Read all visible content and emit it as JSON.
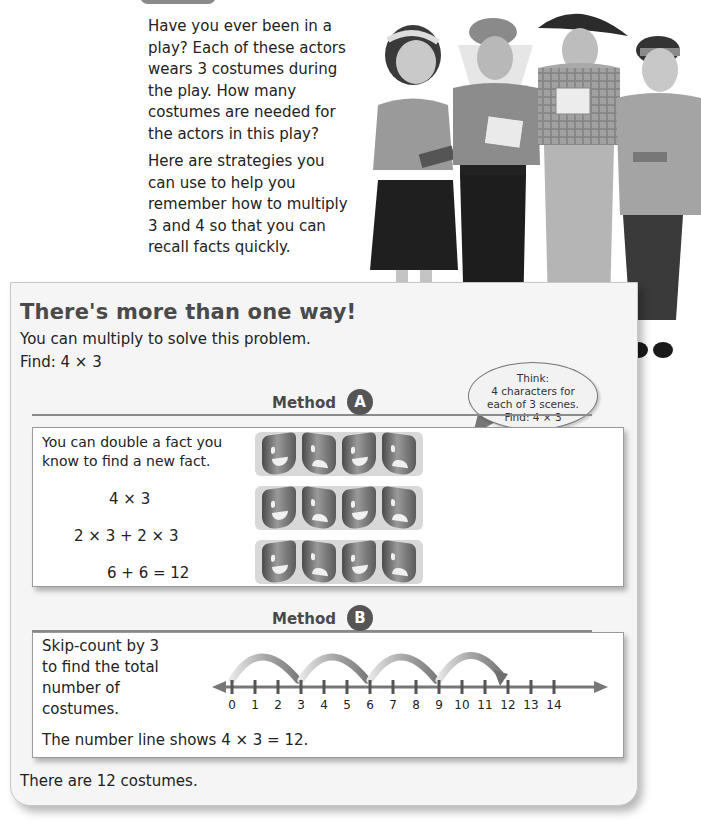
{
  "intro": {
    "paragraph1": "Have you ever been in a play? Each of these actors wears 3 costumes during the play. How many costumes are needed for the actors in this play?",
    "paragraph2": "Here are strategies you can use to help you remember how to multiply 3 and 4 so that you can recall facts quickly."
  },
  "photo": {
    "icon": "actors-photo",
    "description": "Four children in costumes holding scripts"
  },
  "panel": {
    "title": "There's more than one way!",
    "subtitle": "You can multiply to solve this problem.",
    "find": "Find:  4 × 3"
  },
  "bubble": {
    "line1": "Think:",
    "line2": "4 characters for",
    "line3": "each of 3 scenes.",
    "line4": "Find:  4 × 3"
  },
  "method_a": {
    "label": "Method",
    "badge": "A",
    "text_line1": "You can double a fact you",
    "text_line2": "know to find a new fact.",
    "eq1": "4 × 3",
    "eq2": "2 × 3 + 2 × 3",
    "eq3": "6 + 6 = 12",
    "masks": [
      [
        "happy",
        "sad",
        "happy",
        "sad"
      ],
      [
        "happy",
        "sad",
        "happy",
        "sad"
      ],
      [
        "happy",
        "sad",
        "happy",
        "sad"
      ]
    ]
  },
  "method_b": {
    "label": "Method",
    "badge": "B",
    "text_line1": "Skip-count by 3",
    "text_line2": "to find the total",
    "text_line3": "number of",
    "text_line4": "costumes.",
    "caption": "The number line shows 4 × 3 = 12.",
    "number_line": {
      "ticks": [
        "0",
        "1",
        "2",
        "3",
        "4",
        "5",
        "6",
        "7",
        "8",
        "9",
        "10",
        "11",
        "12",
        "13",
        "14"
      ],
      "jumps": [
        [
          0,
          3
        ],
        [
          3,
          6
        ],
        [
          6,
          9
        ],
        [
          9,
          12
        ]
      ]
    }
  },
  "conclusion": "There are 12 costumes."
}
